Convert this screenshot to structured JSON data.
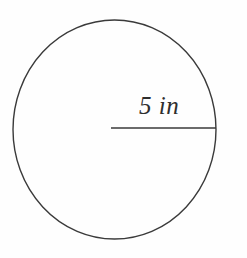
{
  "figure": {
    "kind": "circle-with-radius-diagram",
    "background_color": "#fefefe",
    "stroke_color": "#3a3a3a",
    "text_color": "#2e2e2e",
    "width": 247,
    "height": 258
  },
  "circle": {
    "name": "circle-outline",
    "center_x": 114.5,
    "center_y": 129.5,
    "radius_x": 101.5,
    "radius_y": 109.5,
    "stroke_width": 1.4,
    "fill": "none"
  },
  "radius": {
    "name": "radius-line",
    "label": "5 in",
    "value": 5,
    "unit": "in",
    "x1": 111,
    "y1": 128,
    "x2": 216,
    "y2": 128,
    "stroke_width": 1.3,
    "label_x": 139,
    "label_y": 93
  },
  "chart_data": {
    "type": "diagram",
    "title": "",
    "shapes": [
      {
        "shape": "circle",
        "center": [
          114.5,
          129.5
        ],
        "radius_px": [
          101.5,
          109.5
        ]
      },
      {
        "shape": "segment",
        "role": "radius",
        "from": [
          111,
          128
        ],
        "to": [
          216,
          128
        ],
        "label": "5 in",
        "measure": 5,
        "unit": "in"
      }
    ],
    "annotations": [
      "5 in"
    ]
  }
}
